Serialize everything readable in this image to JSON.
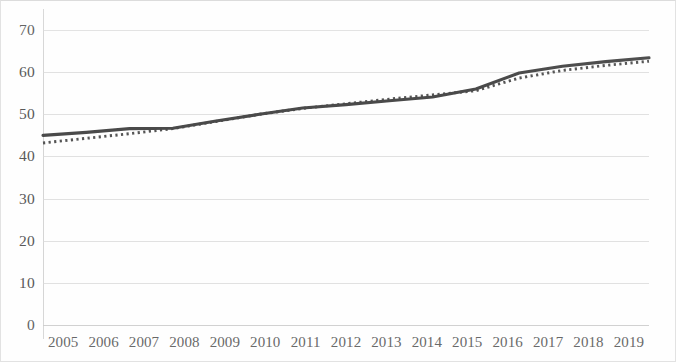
{
  "chart_data": {
    "type": "line",
    "title": "",
    "subtitle": "",
    "xlabel": "",
    "ylabel": "",
    "categories": [
      "2005",
      "2006",
      "2007",
      "2008",
      "2009",
      "2010",
      "2011",
      "2012",
      "2013",
      "2014",
      "2015",
      "2016",
      "2017",
      "2018",
      "2019"
    ],
    "x_tick_labels": [
      "2005",
      "2006",
      "2007",
      "2008",
      "2009",
      "2010",
      "2011",
      "2012",
      "2013",
      "2014",
      "2015",
      "2016",
      "2017",
      "2018",
      "2019"
    ],
    "y_tick_labels": [
      "0",
      "10",
      "20",
      "30",
      "40",
      "50",
      "60",
      "70"
    ],
    "y_ticks": [
      0,
      10,
      20,
      30,
      40,
      50,
      60,
      70
    ],
    "ylim": [
      0,
      70
    ],
    "xlim": [
      "2005",
      "2019"
    ],
    "grid": "horizontal",
    "legend": "none",
    "series": [
      {
        "name": "solid-line-series",
        "style": "solid",
        "color": "#4a4a4a",
        "values": [
          45.0,
          45.7,
          46.6,
          46.7,
          48.4,
          50.0,
          51.5,
          52.3,
          53.2,
          54.1,
          56.0,
          59.8,
          61.4,
          62.5,
          63.4
        ]
      },
      {
        "name": "dotted-line-series",
        "style": "dotted",
        "color": "#555555",
        "values": [
          43.2,
          44.3,
          45.4,
          46.6,
          48.3,
          50.0,
          51.4,
          52.5,
          53.6,
          54.6,
          55.6,
          58.6,
          60.4,
          61.6,
          62.6
        ]
      }
    ]
  },
  "axes": {
    "gridline_color": "#d8d8d8",
    "axis_line_color": "#d5d5d5",
    "tick_text_color": "#595959"
  },
  "figure": {
    "border_color": "#e2e2e2",
    "background": "#fefefe"
  }
}
